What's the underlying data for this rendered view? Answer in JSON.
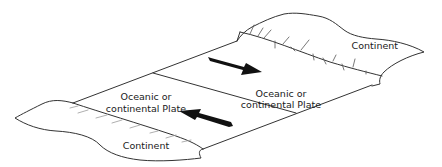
{
  "diagram": {
    "type": "transform-plate-boundary",
    "labels": {
      "top_continent": "Continent",
      "bottom_continent": "Continent",
      "right_plate_line1": "Oceanic or",
      "right_plate_line2": "continental Plate",
      "left_plate_line1": "Oceanic or",
      "left_plate_line2": "continental Plate"
    },
    "arrows": [
      {
        "name": "right-plate-motion",
        "direction": "down-right"
      },
      {
        "name": "left-plate-motion",
        "direction": "up-left"
      }
    ],
    "colors": {
      "line": "#333333",
      "arrow": "#111111",
      "background": "#ffffff",
      "text": "#1a1a1a"
    }
  }
}
